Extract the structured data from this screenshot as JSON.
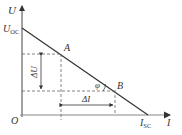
{
  "diagram": {
    "title": "",
    "axes": {
      "y_label": "U",
      "x_label": "I",
      "origin_label": "O"
    },
    "intercepts": {
      "y_intercept_label": "U",
      "y_intercept_sub": "OC",
      "x_intercept_label": "I",
      "x_intercept_sub": "SC"
    },
    "points": [
      {
        "label": "A"
      },
      {
        "label": "B"
      }
    ],
    "deltas": {
      "delta_u": "ΔU",
      "delta_i": "ΔI"
    },
    "angle_label": "φ",
    "colors": {
      "line": "#333333",
      "axis": "#555555",
      "dashed": "#666666"
    }
  }
}
